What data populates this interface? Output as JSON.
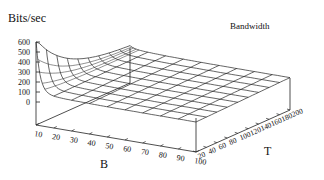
{
  "chart_data": {
    "type": "surface3d",
    "title": "Bandwidth",
    "zlabel": "Bits/sec",
    "xlabel": "B",
    "ylabel": "T",
    "z_ticks": [
      600,
      500,
      400,
      300,
      200,
      100,
      0
    ],
    "x_ticks": [
      10,
      20,
      30,
      40,
      50,
      60,
      70,
      80,
      90,
      100
    ],
    "y_ticks": [
      20,
      40,
      60,
      80,
      100,
      120,
      140,
      160,
      180,
      200
    ],
    "zlim": [
      0,
      600
    ],
    "xlim": [
      10,
      100
    ],
    "ylim": [
      20,
      200
    ],
    "legend": [
      "Bandwidth"
    ],
    "grid": false,
    "surface_samples": {
      "B": [
        10,
        20,
        30,
        40,
        50,
        60,
        70,
        80,
        90,
        100
      ],
      "T": [
        20,
        40,
        60,
        80,
        100,
        120,
        140,
        160,
        180,
        200
      ],
      "Z_at_T20": [
        600,
        120,
        80,
        70,
        70,
        70,
        70,
        70,
        70,
        70
      ],
      "Z_typical_plateau": 80
    }
  },
  "labels": {
    "zlabel": "Bits/sec",
    "legend": "Bandwidth",
    "xlabel": "B",
    "ylabel": "T"
  }
}
